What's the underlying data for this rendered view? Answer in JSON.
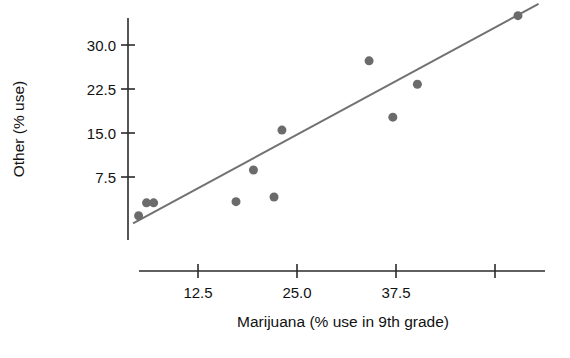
{
  "chart_data": {
    "type": "scatter",
    "title": "",
    "xlabel": "Marijuana (% use in 9th grade)",
    "ylabel": "Other (% use)",
    "xlim": [
      2.0,
      57.0
    ],
    "ylim": [
      -1.0,
      37.0
    ],
    "grid": false,
    "legend": null,
    "xticks": [
      {
        "value": 12.5,
        "label": "12.5"
      },
      {
        "value": 25.0,
        "label": "25.0"
      },
      {
        "value": 37.5,
        "label": "37.5"
      },
      {
        "value": 50.0,
        "label": ""
      }
    ],
    "yticks": [
      {
        "value": 30.0,
        "label": "30.0"
      },
      {
        "value": 22.5,
        "label": "22.5"
      },
      {
        "value": 15.0,
        "label": "15.0"
      },
      {
        "value": 7.5,
        "label": "7.5"
      }
    ],
    "series": [
      {
        "name": "states",
        "marker": "circle",
        "color": "#6b6b6b",
        "marker_size": 9,
        "points": [
          {
            "x": 5.0,
            "y": 0.9
          },
          {
            "x": 6.0,
            "y": 3.1
          },
          {
            "x": 6.9,
            "y": 3.1
          },
          {
            "x": 17.3,
            "y": 3.3
          },
          {
            "x": 19.5,
            "y": 8.7
          },
          {
            "x": 22.1,
            "y": 4.1
          },
          {
            "x": 23.1,
            "y": 15.5
          },
          {
            "x": 34.1,
            "y": 27.3
          },
          {
            "x": 37.1,
            "y": 17.7
          },
          {
            "x": 40.2,
            "y": 23.3
          },
          {
            "x": 52.9,
            "y": 35.0
          }
        ]
      }
    ],
    "fit_line": {
      "name": "regression-line",
      "color": "#717171",
      "width": 2,
      "x_start": 4.3,
      "y_start": -0.4,
      "x_end": 55.5,
      "y_end": 37.0
    },
    "axis_color": "#2b2b2b"
  }
}
